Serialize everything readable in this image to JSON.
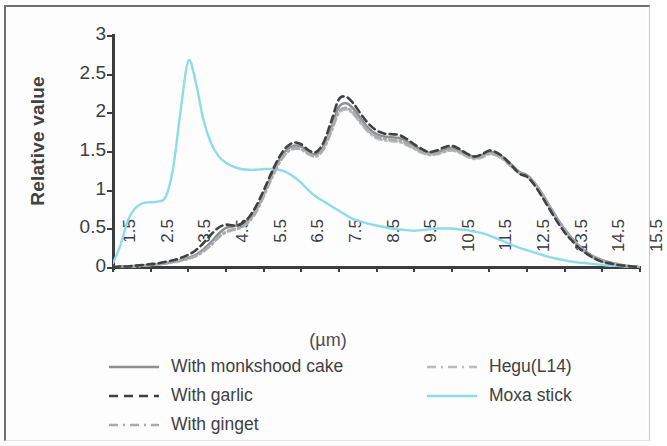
{
  "chart_data": {
    "type": "line",
    "title": "",
    "xlabel": "(µm)",
    "ylabel": "Relative value",
    "xlim": [
      1.5,
      15.5
    ],
    "ylim": [
      0,
      3
    ],
    "grid": false,
    "legend_position": "below-plot",
    "x_tick_labels": [
      "1.5",
      "2.5",
      "3.5",
      "4.5",
      "5.5",
      "6.5",
      "7.5",
      "8.5",
      "9.5",
      "10.5",
      "11.5",
      "12.5",
      "13.5",
      "14.5",
      "15.5"
    ],
    "y_tick_labels": [
      "0",
      "0.5",
      "1",
      "1.5",
      "2",
      "2.5",
      "3"
    ],
    "x": [
      1.5,
      1.7,
      1.9,
      2.1,
      2.3,
      2.5,
      2.7,
      2.9,
      3.1,
      3.3,
      3.5,
      3.7,
      3.9,
      4.1,
      4.3,
      4.5,
      4.7,
      4.9,
      5.1,
      5.3,
      5.5,
      5.7,
      5.9,
      6.1,
      6.3,
      6.5,
      6.7,
      6.9,
      7.1,
      7.3,
      7.5,
      7.7,
      7.9,
      8.1,
      8.3,
      8.5,
      8.7,
      8.9,
      9.1,
      9.3,
      9.5,
      9.7,
      9.9,
      10.1,
      10.3,
      10.5,
      10.7,
      10.9,
      11.1,
      11.3,
      11.5,
      11.7,
      11.9,
      12.1,
      12.3,
      12.5,
      12.7,
      12.9,
      13.1,
      13.3,
      13.5,
      13.7,
      13.9,
      14.1,
      14.3,
      14.5,
      14.7,
      14.9,
      15.1,
      15.3,
      15.5
    ],
    "series": [
      {
        "name": "With monkshood cake",
        "color": "#8d8f91",
        "style": "solid",
        "values": [
          0.01,
          0.02,
          0.02,
          0.03,
          0.03,
          0.04,
          0.05,
          0.06,
          0.08,
          0.1,
          0.13,
          0.17,
          0.24,
          0.33,
          0.44,
          0.52,
          0.54,
          0.56,
          0.62,
          0.75,
          0.95,
          1.18,
          1.38,
          1.52,
          1.58,
          1.57,
          1.5,
          1.47,
          1.58,
          1.82,
          2.08,
          2.13,
          2.05,
          1.92,
          1.8,
          1.73,
          1.7,
          1.69,
          1.68,
          1.64,
          1.58,
          1.52,
          1.49,
          1.5,
          1.53,
          1.55,
          1.52,
          1.47,
          1.44,
          1.46,
          1.5,
          1.48,
          1.42,
          1.33,
          1.24,
          1.2,
          1.1,
          0.96,
          0.8,
          0.64,
          0.5,
          0.38,
          0.28,
          0.2,
          0.14,
          0.1,
          0.07,
          0.05,
          0.03,
          0.02,
          0.01
        ]
      },
      {
        "name": "With garlic",
        "color": "#3f4143",
        "style": "dashed",
        "values": [
          0.01,
          0.02,
          0.02,
          0.03,
          0.04,
          0.05,
          0.06,
          0.08,
          0.1,
          0.13,
          0.17,
          0.23,
          0.32,
          0.43,
          0.52,
          0.56,
          0.55,
          0.57,
          0.65,
          0.8,
          1.0,
          1.22,
          1.42,
          1.56,
          1.62,
          1.6,
          1.52,
          1.5,
          1.63,
          1.9,
          2.18,
          2.21,
          2.12,
          1.98,
          1.86,
          1.78,
          1.74,
          1.73,
          1.72,
          1.67,
          1.6,
          1.54,
          1.5,
          1.52,
          1.56,
          1.58,
          1.54,
          1.48,
          1.44,
          1.47,
          1.52,
          1.49,
          1.42,
          1.32,
          1.22,
          1.18,
          1.07,
          0.92,
          0.76,
          0.6,
          0.46,
          0.35,
          0.25,
          0.18,
          0.12,
          0.08,
          0.06,
          0.04,
          0.03,
          0.02,
          0.01
        ]
      },
      {
        "name": "With ginget",
        "color": "#a9abad",
        "style": "dash-dot",
        "values": [
          0.01,
          0.01,
          0.02,
          0.02,
          0.03,
          0.04,
          0.05,
          0.06,
          0.08,
          0.1,
          0.12,
          0.16,
          0.22,
          0.3,
          0.4,
          0.47,
          0.5,
          0.53,
          0.6,
          0.73,
          0.93,
          1.15,
          1.35,
          1.49,
          1.55,
          1.54,
          1.48,
          1.45,
          1.55,
          1.78,
          2.02,
          2.07,
          2.0,
          1.88,
          1.77,
          1.7,
          1.67,
          1.66,
          1.65,
          1.61,
          1.55,
          1.5,
          1.47,
          1.48,
          1.51,
          1.53,
          1.5,
          1.45,
          1.42,
          1.44,
          1.48,
          1.46,
          1.4,
          1.31,
          1.23,
          1.19,
          1.09,
          0.95,
          0.79,
          0.63,
          0.49,
          0.37,
          0.27,
          0.19,
          0.13,
          0.09,
          0.07,
          0.05,
          0.03,
          0.02,
          0.01
        ]
      },
      {
        "name": "Hegu(L14)",
        "color": "#b9bbbd",
        "style": "dash-dot",
        "values": [
          0.01,
          0.01,
          0.02,
          0.02,
          0.03,
          0.04,
          0.05,
          0.06,
          0.07,
          0.09,
          0.12,
          0.15,
          0.21,
          0.29,
          0.39,
          0.46,
          0.49,
          0.52,
          0.59,
          0.72,
          0.92,
          1.14,
          1.34,
          1.48,
          1.54,
          1.53,
          1.47,
          1.44,
          1.54,
          1.76,
          2.0,
          2.05,
          1.98,
          1.86,
          1.75,
          1.68,
          1.65,
          1.64,
          1.63,
          1.59,
          1.54,
          1.49,
          1.46,
          1.47,
          1.5,
          1.52,
          1.49,
          1.44,
          1.41,
          1.43,
          1.47,
          1.45,
          1.39,
          1.3,
          1.22,
          1.18,
          1.08,
          0.94,
          0.78,
          0.62,
          0.48,
          0.36,
          0.26,
          0.18,
          0.12,
          0.08,
          0.06,
          0.04,
          0.03,
          0.02,
          0.01
        ]
      },
      {
        "name": "Moxa stick",
        "color": "#8ddce8",
        "style": "solid",
        "values": [
          0.06,
          0.3,
          0.62,
          0.78,
          0.84,
          0.85,
          0.86,
          0.92,
          1.3,
          2.05,
          2.68,
          2.4,
          1.92,
          1.62,
          1.45,
          1.36,
          1.31,
          1.28,
          1.27,
          1.27,
          1.28,
          1.28,
          1.27,
          1.24,
          1.18,
          1.1,
          1.0,
          0.92,
          0.86,
          0.8,
          0.74,
          0.68,
          0.63,
          0.6,
          0.57,
          0.55,
          0.53,
          0.51,
          0.5,
          0.49,
          0.48,
          0.49,
          0.5,
          0.51,
          0.51,
          0.51,
          0.5,
          0.49,
          0.47,
          0.45,
          0.42,
          0.38,
          0.34,
          0.3,
          0.26,
          0.23,
          0.2,
          0.17,
          0.14,
          0.12,
          0.1,
          0.08,
          0.07,
          0.06,
          0.05,
          0.04,
          0.03,
          0.03,
          0.02,
          0.02,
          0.01
        ]
      }
    ]
  },
  "legend": {
    "left_column": [
      {
        "label": "With monkshood cake",
        "series": "With monkshood cake"
      },
      {
        "label": "With garlic",
        "series": "With garlic"
      },
      {
        "label": "With ginget",
        "series": "With ginget"
      }
    ],
    "right_column": [
      {
        "label": "Hegu(L14)",
        "series": "Hegu(L14)"
      },
      {
        "label": "Moxa stick",
        "series": "Moxa stick"
      }
    ]
  }
}
